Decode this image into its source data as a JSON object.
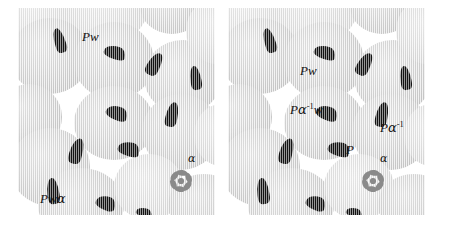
{
  "figure": {
    "type": "two-panel-micrograph-diagram",
    "background_color": "#ffffff",
    "cell_fill_color": "#d4d4d4",
    "inclusion_color": "#131313",
    "label_color": "#111111",
    "star_color": "#8a8a8a"
  },
  "panels": [
    {
      "id": "left",
      "name": "left-panel",
      "labels": [
        {
          "id": "pw",
          "text": "Pw",
          "parts": [
            {
              "t": "P",
              "style": "italic"
            },
            {
              "t": "w",
              "style": "italic"
            }
          ],
          "x": 64,
          "y": 22
        },
        {
          "id": "pwa",
          "text": "Pwα",
          "parts": [
            {
              "t": "P",
              "style": "italic"
            },
            {
              "t": "w",
              "style": "italic"
            },
            {
              "t": "α",
              "style": "greek"
            }
          ],
          "x": 22,
          "y": 184
        },
        {
          "id": "alpha",
          "text": "α",
          "parts": [
            {
              "t": "α",
              "style": "greek"
            }
          ],
          "x": 170,
          "y": 145
        }
      ],
      "star": {
        "id": "alpha-star",
        "x": 148,
        "y": 158,
        "label": "α"
      }
    },
    {
      "id": "right",
      "name": "right-panel",
      "labels": [
        {
          "id": "pw",
          "text": "Pw",
          "parts": [
            {
              "t": "P",
              "style": "italic"
            },
            {
              "t": "w",
              "style": "italic"
            }
          ],
          "x": 72,
          "y": 56
        },
        {
          "id": "painvw",
          "text": "Pα⁻¹w",
          "parts": [
            {
              "t": "P",
              "style": "italic"
            },
            {
              "t": "α",
              "style": "greek"
            },
            {
              "t": "-1",
              "style": "sup"
            },
            {
              "t": "w",
              "style": "italic"
            }
          ],
          "x": 62,
          "y": 94
        },
        {
          "id": "painv",
          "text": "Pα⁻¹",
          "parts": [
            {
              "t": "P",
              "style": "italic"
            },
            {
              "t": "α",
              "style": "greek"
            },
            {
              "t": "-1",
              "style": "sup"
            }
          ],
          "x": 152,
          "y": 112
        },
        {
          "id": "p",
          "text": "P",
          "parts": [
            {
              "t": "P",
              "style": "italic"
            }
          ],
          "x": 118,
          "y": 135
        },
        {
          "id": "alpha",
          "text": "α",
          "parts": [
            {
              "t": "α",
              "style": "greek"
            }
          ],
          "x": 152,
          "y": 145
        }
      ],
      "star": {
        "id": "alpha-star",
        "x": 130,
        "y": 158,
        "label": "α"
      }
    }
  ],
  "cells": {
    "left": [
      {
        "x": -18,
        "y": -28,
        "w": 74,
        "h": 68,
        "pale": true
      },
      {
        "x": 44,
        "y": -38,
        "w": 86,
        "h": 74,
        "pale": true
      },
      {
        "x": 122,
        "y": -30,
        "w": 64,
        "h": 56,
        "pale": false
      },
      {
        "x": -8,
        "y": 10,
        "w": 80,
        "h": 76,
        "pale": false
      },
      {
        "x": 56,
        "y": 14,
        "w": 80,
        "h": 78,
        "pale": false
      },
      {
        "x": 126,
        "y": 32,
        "w": 78,
        "h": 74,
        "pale": false
      },
      {
        "x": 168,
        "y": -10,
        "w": 62,
        "h": 66,
        "pale": true
      },
      {
        "x": 56,
        "y": 78,
        "w": 80,
        "h": 74,
        "pale": false
      },
      {
        "x": 124,
        "y": 86,
        "w": 78,
        "h": 76,
        "pale": false
      },
      {
        "x": -22,
        "y": 76,
        "w": 66,
        "h": 66,
        "pale": false
      },
      {
        "x": -8,
        "y": 120,
        "w": 80,
        "h": 78,
        "pale": false
      },
      {
        "x": 20,
        "y": 160,
        "w": 86,
        "h": 74,
        "pale": false
      },
      {
        "x": 96,
        "y": 146,
        "w": 70,
        "h": 66,
        "pale": true
      },
      {
        "x": 150,
        "y": 166,
        "w": 72,
        "h": 62,
        "pale": false
      },
      {
        "x": 176,
        "y": 96,
        "w": 56,
        "h": 62,
        "pale": true
      }
    ],
    "right": [
      {
        "x": -18,
        "y": -28,
        "w": 74,
        "h": 68,
        "pale": true
      },
      {
        "x": 44,
        "y": -38,
        "w": 86,
        "h": 74,
        "pale": true
      },
      {
        "x": 122,
        "y": -30,
        "w": 64,
        "h": 56,
        "pale": false
      },
      {
        "x": -8,
        "y": 10,
        "w": 80,
        "h": 76,
        "pale": false
      },
      {
        "x": 56,
        "y": 14,
        "w": 80,
        "h": 78,
        "pale": false
      },
      {
        "x": 126,
        "y": 32,
        "w": 78,
        "h": 74,
        "pale": false
      },
      {
        "x": 168,
        "y": -10,
        "w": 62,
        "h": 66,
        "pale": true
      },
      {
        "x": 56,
        "y": 78,
        "w": 80,
        "h": 74,
        "pale": false
      },
      {
        "x": 124,
        "y": 86,
        "w": 78,
        "h": 76,
        "pale": false
      },
      {
        "x": -22,
        "y": 76,
        "w": 66,
        "h": 66,
        "pale": false
      },
      {
        "x": -8,
        "y": 120,
        "w": 80,
        "h": 78,
        "pale": false
      },
      {
        "x": 20,
        "y": 160,
        "w": 86,
        "h": 74,
        "pale": false
      },
      {
        "x": 96,
        "y": 146,
        "w": 70,
        "h": 66,
        "pale": true
      },
      {
        "x": 150,
        "y": 166,
        "w": 72,
        "h": 62,
        "pale": false
      },
      {
        "x": 176,
        "y": 96,
        "w": 56,
        "h": 62,
        "pale": true
      }
    ]
  },
  "inclusions": {
    "left": [
      {
        "x": 36,
        "y": 20,
        "w": 11,
        "h": 25,
        "rot": -18,
        "k": "thin"
      },
      {
        "x": 86,
        "y": 38,
        "w": 22,
        "h": 13,
        "rot": 18,
        "k": "hook"
      },
      {
        "x": 130,
        "y": 44,
        "w": 13,
        "h": 24,
        "rot": 28,
        "k": "thin"
      },
      {
        "x": 172,
        "y": 58,
        "w": 11,
        "h": 24,
        "rot": -10,
        "k": "thin"
      },
      {
        "x": 88,
        "y": 98,
        "w": 22,
        "h": 14,
        "rot": 22,
        "k": "hook"
      },
      {
        "x": 148,
        "y": 94,
        "w": 12,
        "h": 25,
        "rot": 12,
        "k": "thin"
      },
      {
        "x": 52,
        "y": 130,
        "w": 13,
        "h": 26,
        "rot": 16,
        "k": "thin"
      },
      {
        "x": 100,
        "y": 134,
        "w": 22,
        "h": 14,
        "rot": 16,
        "k": "hook"
      },
      {
        "x": 29,
        "y": 170,
        "w": 12,
        "h": 26,
        "rot": -8,
        "k": "thin"
      },
      {
        "x": 78,
        "y": 188,
        "w": 20,
        "h": 14,
        "rot": 22,
        "k": "hook"
      },
      {
        "x": 118,
        "y": 200,
        "w": 16,
        "h": 9,
        "rot": 16,
        "k": "hook"
      }
    ],
    "right": [
      {
        "x": 36,
        "y": 20,
        "w": 11,
        "h": 25,
        "rot": -18,
        "k": "thin"
      },
      {
        "x": 86,
        "y": 38,
        "w": 22,
        "h": 13,
        "rot": 18,
        "k": "hook"
      },
      {
        "x": 130,
        "y": 44,
        "w": 13,
        "h": 24,
        "rot": 28,
        "k": "thin"
      },
      {
        "x": 172,
        "y": 58,
        "w": 11,
        "h": 24,
        "rot": -10,
        "k": "thin"
      },
      {
        "x": 88,
        "y": 98,
        "w": 22,
        "h": 14,
        "rot": 22,
        "k": "hook"
      },
      {
        "x": 148,
        "y": 94,
        "w": 12,
        "h": 25,
        "rot": 12,
        "k": "thin"
      },
      {
        "x": 52,
        "y": 130,
        "w": 13,
        "h": 26,
        "rot": 16,
        "k": "thin"
      },
      {
        "x": 100,
        "y": 134,
        "w": 22,
        "h": 14,
        "rot": 16,
        "k": "hook"
      },
      {
        "x": 29,
        "y": 170,
        "w": 12,
        "h": 26,
        "rot": -8,
        "k": "thin"
      },
      {
        "x": 78,
        "y": 188,
        "w": 20,
        "h": 14,
        "rot": 22,
        "k": "hook"
      },
      {
        "x": 118,
        "y": 200,
        "w": 16,
        "h": 9,
        "rot": 16,
        "k": "hook"
      }
    ]
  }
}
